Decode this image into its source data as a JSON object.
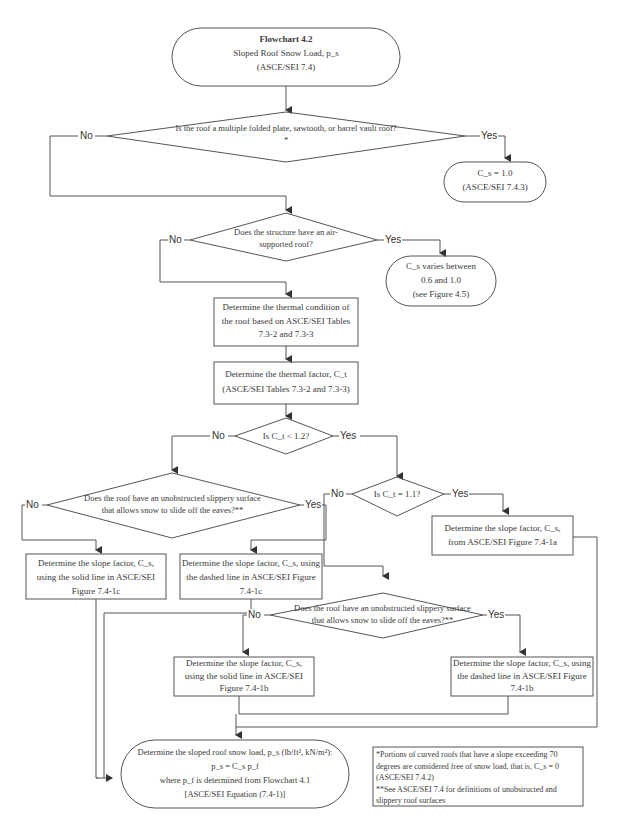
{
  "flowchart": {
    "title": "Flowchart 4.2",
    "subtitle": "Sloped Roof Snow Load, p_s",
    "reference": "(ASCE/SEI 7.4)",
    "nodes": {
      "q_folded": "Is the roof a multiple folded plate, sawtooth, or barrel vault roof?*",
      "cs_1_0_line1": "C_s = 1.0",
      "cs_1_0_line2": "(ASCE/SEI 7.4.3)",
      "q_air": "Does the structure have an air-supported roof?",
      "cs_varies_line1": "C_s varies between",
      "cs_varies_line2": "0.6 and 1.0",
      "cs_varies_line3": "(see Figure 4.5)",
      "thermal_condition": "Determine the thermal condition of the roof based on ASCE/SEI Tables 7.3-2 and 7.3-3",
      "thermal_factor_line1": "Determine the thermal factor, C_t",
      "thermal_factor_line2": "(ASCE/SEI Tables 7.3-2 and 7.3-3)",
      "q_ct_lt_12": "Is C_t < 1.2?",
      "q_ct_eq_11": "Is C_t = 1.1?",
      "q_slippery": "Does the roof have an unobstructed slippery surface that allows snow to slide off the eaves?**",
      "slope_solid_1c": "Determine the slope factor, C_s, using the solid line in ASCE/SEI Figure 7.4-1c",
      "slope_dashed_1c": "Determine the slope factor, C_s, using the dashed line in ASCE/SEI Figure 7.4-1c",
      "slope_1a": "Determine the slope factor, C_s, from ASCE/SEI Figure 7.4-1a",
      "slope_solid_1b": "Determine the slope factor, C_s, using the solid line in ASCE/SEI Figure 7.4-1b",
      "slope_dashed_1b": "Determine the slope factor, C_s, using the dashed line in ASCE/SEI Figure 7.4-1b",
      "final_line1": "Determine the sloped roof snow load, p_s (lb/ft², kN/m²):",
      "final_line2": "p_s = C_s p_f",
      "final_line3": "where p_f is determined from Flowchart 4.1",
      "final_line4": "[ASCE/SEI Equation (7.4-1)]"
    },
    "labels": {
      "yes": "Yes",
      "no": "No"
    },
    "footnotes": {
      "star": "*Portions of curved roofs that have a slope exceeding 70 degrees are considered free of snow load, that is, C_s = 0 (ASCE/SEI 7.4.2)",
      "double_star": "**See ASCE/SEI 7.4 for definitions of unobstructed and slippery roof surfaces"
    }
  }
}
